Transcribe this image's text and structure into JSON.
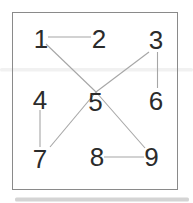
{
  "figure": {
    "width": 193,
    "height": 203,
    "background": "#ffffff",
    "frame": {
      "x": 12.5,
      "y": 12.5,
      "width": 165,
      "height": 177,
      "stroke": "#8a8a8a",
      "stroke_width": 1,
      "fill": "#ffffff"
    },
    "artifact_bands": [
      {
        "x": 0,
        "y": 68,
        "width": 193,
        "height": 3.5,
        "fill": "#f0f0f0",
        "opacity": 0.9
      },
      {
        "x": 15,
        "y": 197.5,
        "width": 174,
        "height": 4,
        "fill": "#c6c6c6",
        "opacity": 0.75
      }
    ]
  },
  "graph": {
    "node_color": "#2b2b2b",
    "node_font_size": 26,
    "edge_color": "#a6a6a6",
    "edge_width": 1.1,
    "nodes": [
      {
        "id": "1",
        "label": "1",
        "x": 41,
        "y": 39
      },
      {
        "id": "2",
        "label": "2",
        "x": 99,
        "y": 39
      },
      {
        "id": "3",
        "label": "3",
        "x": 156,
        "y": 40
      },
      {
        "id": "4",
        "label": "4",
        "x": 40,
        "y": 100
      },
      {
        "id": "5",
        "label": "5",
        "x": 95.5,
        "y": 101.5
      },
      {
        "id": "6",
        "label": "6",
        "x": 156,
        "y": 101
      },
      {
        "id": "7",
        "label": "7",
        "x": 40,
        "y": 159
      },
      {
        "id": "8",
        "label": "8",
        "x": 97,
        "y": 157
      },
      {
        "id": "9",
        "label": "9",
        "x": 151.5,
        "y": 157
      }
    ],
    "edges": [
      {
        "from": "1",
        "to": "2",
        "x1": 48,
        "y1": 37,
        "x2": 91,
        "y2": 37
      },
      {
        "from": "1",
        "to": "5",
        "x1": 46,
        "y1": 44,
        "x2": 96,
        "y2": 92
      },
      {
        "from": "3",
        "to": "5",
        "x1": 149,
        "y1": 52,
        "x2": 96,
        "y2": 92
      },
      {
        "from": "3",
        "to": "6",
        "x1": 157.5,
        "y1": 52,
        "x2": 157.5,
        "y2": 88
      },
      {
        "from": "4",
        "to": "7",
        "x1": 40,
        "y1": 110,
        "x2": 40,
        "y2": 147
      },
      {
        "from": "5",
        "to": "7",
        "x1": 96,
        "y1": 92,
        "x2": 50,
        "y2": 147
      },
      {
        "from": "5",
        "to": "9",
        "x1": 96,
        "y1": 92,
        "x2": 145,
        "y2": 148
      },
      {
        "from": "8",
        "to": "9",
        "x1": 104,
        "y1": 157,
        "x2": 144,
        "y2": 157
      }
    ]
  }
}
